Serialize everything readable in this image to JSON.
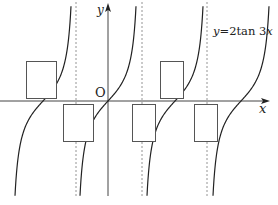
{
  "figure": {
    "equation_label": {
      "var_y": "y",
      "equals": "=2tan 3",
      "var_x": "x"
    },
    "axis_labels": {
      "x": "x",
      "y": "y",
      "origin": "O"
    },
    "colors": {
      "curve": "#222222",
      "axis": "#444444",
      "asymptote": "#888888",
      "box_border": "#555555"
    },
    "blank_boxes": [
      {
        "id": 1,
        "x": 26,
        "y": 61,
        "w": 31,
        "h": 38,
        "position": "above-axis-left"
      },
      {
        "id": 2,
        "x": 63,
        "y": 104,
        "w": 31,
        "h": 38,
        "position": "below-axis-left"
      },
      {
        "id": 3,
        "x": 132,
        "y": 104,
        "w": 24,
        "h": 38,
        "position": "below-axis-mid"
      },
      {
        "id": 4,
        "x": 160,
        "y": 61,
        "w": 24,
        "h": 38,
        "position": "above-axis-right"
      },
      {
        "id": 5,
        "x": 194,
        "y": 104,
        "w": 24,
        "h": 38,
        "position": "below-axis-right"
      }
    ]
  },
  "chart_data": {
    "type": "line",
    "xlabel": "x",
    "ylabel": "y",
    "function": "y = 2 tan 3x",
    "period": "π/3",
    "asymptotes_screen_x": [
      76,
      142,
      207
    ],
    "zeros_screen_x": [
      43,
      108,
      175,
      241
    ],
    "grid": false,
    "legend": "none"
  }
}
